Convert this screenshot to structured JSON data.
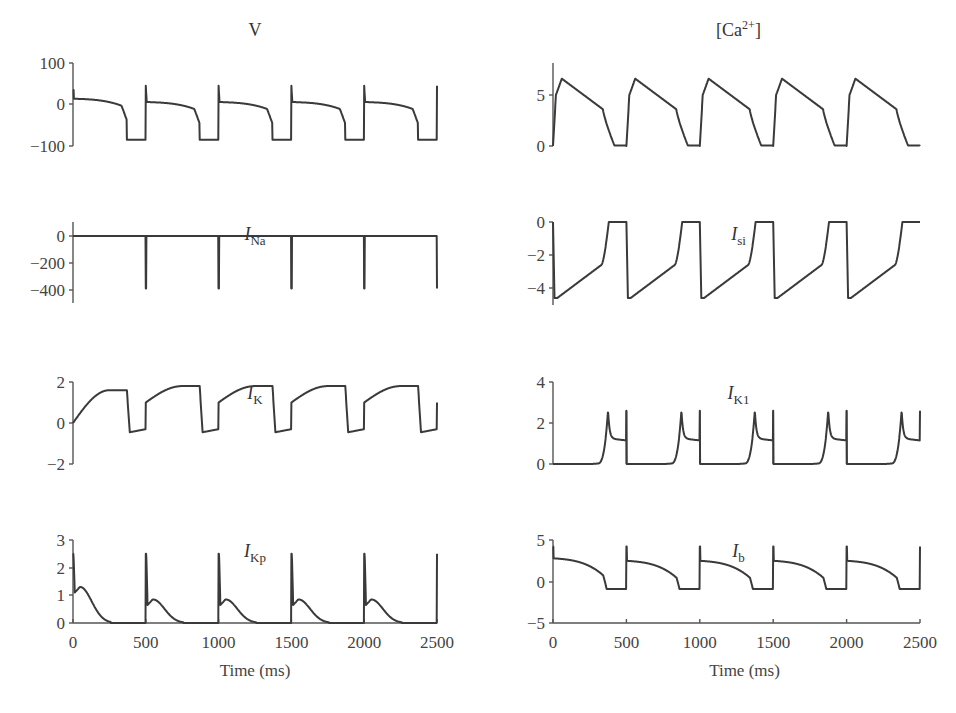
{
  "figure": {
    "x_axis_label": "Time (ms)",
    "x_ticks": [
      "0",
      "500",
      "1000",
      "1500",
      "2000",
      "2500"
    ],
    "line_color": "#3a3a3a"
  },
  "chart_data": [
    {
      "type": "line",
      "title": "V",
      "title_main": "V",
      "title_sub": "",
      "ylim": [
        -100,
        100
      ],
      "yticks": [
        100,
        0,
        -100
      ],
      "xlim": [
        0,
        2500
      ],
      "xlabel": "",
      "ylabel": "",
      "description": "Action potentials every 500 ms: spike to ~50, plateau ~10 decaying to repolarize near 380 ms, rest at ~-85",
      "x": [
        0,
        5,
        50,
        200,
        330,
        370,
        380,
        500,
        505,
        510,
        550,
        700,
        830,
        870,
        880,
        1000
      ],
      "values": [
        -85,
        40,
        12,
        0,
        -40,
        -80,
        -85,
        -85,
        45,
        5,
        5,
        -10,
        -40,
        -80,
        -85,
        -85
      ]
    },
    {
      "type": "line",
      "title": "[Ca2+]",
      "title_main": "[Ca",
      "title_sup": "2+",
      "title_end": "]",
      "ylim": [
        0,
        8
      ],
      "yticks": [
        5,
        0
      ],
      "xlim": [
        0,
        2500
      ],
      "description": "Calcium transients every 500 ms peaking ~6.6 at ~60 ms after stimulus, declining to ~3.5 by ~350 ms, then dropping to 0",
      "x": [
        0,
        20,
        60,
        200,
        350,
        400,
        450,
        500
      ],
      "values": [
        0,
        5,
        6.6,
        5.2,
        3.6,
        0.5,
        0.05,
        0.05
      ]
    },
    {
      "type": "line",
      "title": "I_Na",
      "title_main": "I",
      "title_sub": "Na",
      "ylim": [
        -500,
        100
      ],
      "yticks": [
        0,
        -200,
        -400
      ],
      "xlim": [
        0,
        2500
      ],
      "description": "Near zero except sharp negative spikes to ~-390 at 500,1000,1500,2000 ms",
      "x": [
        500,
        1000,
        1500,
        2000
      ],
      "values": [
        -390,
        -390,
        -390,
        -390
      ]
    },
    {
      "type": "line",
      "title": "I_si",
      "title_main": "I",
      "title_sub": "si",
      "ylim": [
        -5,
        0
      ],
      "yticks": [
        0,
        -2,
        -4
      ],
      "xlim": [
        0,
        2500
      ],
      "description": "Slow inward current: drops to ~-4.6 at stimulus, recovers to ~-2.5 by 340 ms then to 0 by ~400 ms",
      "x": [
        0,
        20,
        200,
        340,
        390,
        500
      ],
      "values": [
        0,
        -4.6,
        -3.6,
        -2.5,
        0,
        0
      ]
    },
    {
      "type": "line",
      "title": "I_K",
      "title_main": "I",
      "title_sub": "K",
      "ylim": [
        -2,
        2
      ],
      "yticks": [
        2,
        0,
        -2
      ],
      "xlim": [
        0,
        2500
      ],
      "description": "Rises to ~1.7-1.8 during plateau, drops to ~-0.5 at repolarization, jumps to ~1.0 at stimulus",
      "x": [
        0,
        150,
        370,
        390,
        500,
        505,
        650,
        830,
        850,
        1000
      ],
      "values": [
        0,
        1.5,
        1.6,
        -0.4,
        -0.3,
        1.0,
        1.8,
        1.6,
        -0.4,
        -0.3
      ]
    },
    {
      "type": "line",
      "title": "I_K1",
      "title_main": "I",
      "title_sub": "K1",
      "ylim": [
        0,
        4
      ],
      "yticks": [
        4,
        2,
        0
      ],
      "xlim": [
        0,
        2500
      ],
      "description": "Zero during plateau, rises at repolarization with peak ~2.6 at ~375 ms, decays to ~1.3 until next stimulus",
      "x": [
        0,
        300,
        375,
        400,
        500
      ],
      "values": [
        0,
        0,
        2.6,
        1.4,
        1.25
      ]
    },
    {
      "type": "line",
      "title": "I_Kp",
      "title_main": "I",
      "title_sub": "Kp",
      "ylim": [
        0,
        3
      ],
      "yticks": [
        3,
        2,
        1,
        0
      ],
      "xlim": [
        0,
        2500
      ],
      "description": "Spike to ~2.5 at each stimulus, secondary hump ~1.3 (first beat) and ~0.8 (later beats), decays to 0 by ~250 ms",
      "x": [
        0,
        10,
        50,
        250,
        500,
        510,
        550,
        720
      ],
      "values": [
        2.5,
        1.1,
        1.3,
        0,
        2.5,
        0.6,
        0.8,
        0
      ]
    },
    {
      "type": "line",
      "title": "I_b",
      "title_main": "I",
      "title_sub": "b",
      "ylim": [
        -5,
        5
      ],
      "yticks": [
        5,
        0,
        -5
      ],
      "xlim": [
        0,
        2500
      ],
      "description": "Background current mirrors V: spike ~4.2, plateau ~2.7 decaying, drops to ~-0.9 at rest",
      "x": [
        0,
        5,
        20,
        300,
        380,
        500
      ],
      "values": [
        -0.9,
        4.3,
        2.7,
        1.5,
        -0.9,
        -0.9
      ]
    }
  ]
}
